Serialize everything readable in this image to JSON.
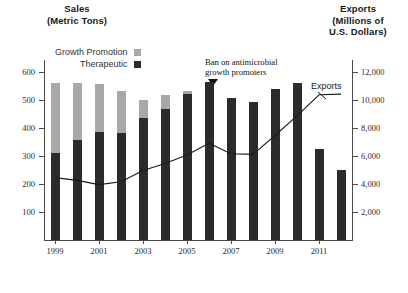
{
  "axes": {
    "left_title_lines": [
      "Sales",
      "(Metric Tons)"
    ],
    "right_title_lines": [
      "Exports",
      "(Millions of",
      "U.S. Dollars)"
    ],
    "left_ticks": [
      "600",
      "500",
      "400",
      "300",
      "200",
      "100"
    ],
    "right_ticks": [
      "12,000",
      "10,000",
      "8,000",
      "6,000",
      "4,000",
      "2,000"
    ],
    "x_ticks": [
      "1999",
      "2001",
      "2003",
      "2005",
      "2007",
      "2009",
      "2011"
    ]
  },
  "legend": {
    "growth_promotion": "Growth Promotion",
    "therapeutic": "Therapeutic"
  },
  "annotation": {
    "ban_line1": "Ban on antimicrobial",
    "ban_line2": "growth promoters",
    "exports_line_label": "Exports"
  },
  "colors": {
    "growth_promotion": "#a8a8a8",
    "therapeutic": "#2b2b2b",
    "line": "#1a1a1a",
    "axis": "#4a4a4a"
  },
  "chart_data": {
    "type": "bar",
    "xlabel": "",
    "ylabel": "Sales (Metric Tons)",
    "y2label": "Exports (Millions of U.S. Dollars)",
    "ylim": [
      0,
      620
    ],
    "y2lim": [
      0,
      12400
    ],
    "grid": false,
    "legend_position": "top-left",
    "categories": [
      "1999",
      "2000",
      "2001",
      "2002",
      "2003",
      "2004",
      "2005",
      "2006",
      "2007",
      "2008",
      "2009",
      "2010",
      "2011",
      "2012"
    ],
    "series": [
      {
        "name": "Therapeutic",
        "type": "bar",
        "stack": "sales",
        "color": "#2b2b2b",
        "axis": "left",
        "values": [
          310,
          358,
          385,
          380,
          435,
          468,
          520,
          562,
          505,
          492,
          540,
          558,
          325,
          248
        ]
      },
      {
        "name": "Growth Promotion",
        "type": "bar",
        "stack": "sales",
        "color": "#a8a8a8",
        "axis": "left",
        "values": [
          248,
          200,
          172,
          152,
          65,
          50,
          12,
          0,
          0,
          0,
          0,
          0,
          0,
          0
        ]
      },
      {
        "name": "Exports",
        "type": "line",
        "color": "#1a1a1a",
        "axis": "right",
        "values": [
          4450,
          4250,
          3950,
          4150,
          4950,
          5450,
          6050,
          6900,
          6150,
          6100,
          7450,
          8850,
          10350,
          10400
        ]
      }
    ],
    "annotations": [
      {
        "text": "Ban on antimicrobial growth promoters",
        "at_category": "2006"
      },
      {
        "text": "Exports",
        "at_category": "2011"
      }
    ]
  }
}
